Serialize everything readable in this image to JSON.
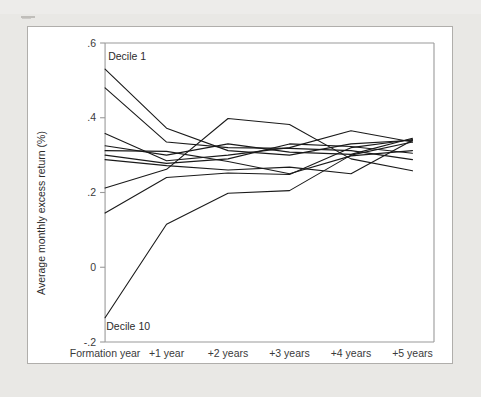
{
  "figure": {
    "background_color": "#e9e8e5",
    "panel_color": "#ffffff",
    "border_color": "#b0aeab",
    "line_color": "#1a1a1a",
    "axis_color": "#9a9a9a"
  },
  "chart_data": {
    "type": "line",
    "title": "",
    "subtitle": "",
    "xlabel": "",
    "ylabel": "Average monthly excess return (%)",
    "grid": false,
    "legend_position": "none",
    "categories": [
      "Formation year",
      "+1 year",
      "+2 years",
      "+3 years",
      "+4 years",
      "+5 years"
    ],
    "x": [
      0,
      1,
      2,
      3,
      4,
      5
    ],
    "xlim": [
      -0.18,
      5.35
    ],
    "ylim": [
      -0.2,
      0.6
    ],
    "yticks": [
      -0.2,
      0,
      0.2,
      0.4,
      0.6
    ],
    "ytick_labels": [
      "-.2",
      "0",
      ".2",
      ".4",
      ".6"
    ],
    "xtick_labels": [
      "Formation year",
      "+1 year",
      "+2 years",
      "+3 years",
      "+4 years",
      "+5 years"
    ],
    "annotations": [
      {
        "text": "Decile 1",
        "x": 0.05,
        "y": 0.555,
        "anchor": "start"
      },
      {
        "text": "Decile 10",
        "x": 0.02,
        "y": -0.168,
        "anchor": "start"
      }
    ],
    "series": [
      {
        "name": "Decile 1",
        "values": [
          0.53,
          0.372,
          0.312,
          0.3,
          0.33,
          0.34
        ]
      },
      {
        "name": "Decile 2",
        "values": [
          0.48,
          0.335,
          0.32,
          0.318,
          0.312,
          0.288
        ]
      },
      {
        "name": "Decile 3",
        "values": [
          0.358,
          0.285,
          0.3,
          0.32,
          0.365,
          0.335
        ]
      },
      {
        "name": "Decile 4",
        "values": [
          0.325,
          0.3,
          0.33,
          0.308,
          0.302,
          0.345
        ]
      },
      {
        "name": "Decile 5",
        "values": [
          0.312,
          0.31,
          0.283,
          0.25,
          0.298,
          0.312
        ]
      },
      {
        "name": "Decile 6",
        "values": [
          0.3,
          0.278,
          0.29,
          0.33,
          0.323,
          0.305
        ]
      },
      {
        "name": "Decile 7",
        "values": [
          0.288,
          0.272,
          0.26,
          0.268,
          0.25,
          0.34
        ]
      },
      {
        "name": "Decile 8",
        "values": [
          0.212,
          0.262,
          0.398,
          0.382,
          0.29,
          0.258
        ]
      },
      {
        "name": "Decile 9",
        "values": [
          0.145,
          0.24,
          0.252,
          0.248,
          0.32,
          0.342
        ]
      },
      {
        "name": "Decile 10",
        "values": [
          -0.135,
          0.115,
          0.198,
          0.205,
          0.3,
          0.335
        ]
      }
    ]
  }
}
